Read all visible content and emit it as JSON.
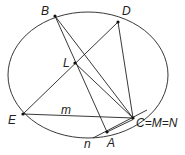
{
  "diagram": {
    "colors": {
      "stroke": "#222222",
      "background": "#ffffff"
    },
    "circle": {
      "cx": 88,
      "cy": 75,
      "rx": 80,
      "ry": 63
    },
    "points": {
      "B": {
        "label": "B",
        "x": 55,
        "y": 16
      },
      "D": {
        "label": "D",
        "x": 118,
        "y": 22
      },
      "L": {
        "label": "L",
        "x": 75,
        "y": 63
      },
      "E": {
        "label": "E",
        "x": 23,
        "y": 114
      },
      "C": {
        "label": "C=M=N",
        "x": 133,
        "y": 118
      },
      "A": {
        "label": "A",
        "x": 107,
        "y": 132
      }
    },
    "line_labels": {
      "m": "m",
      "n": "n"
    }
  }
}
